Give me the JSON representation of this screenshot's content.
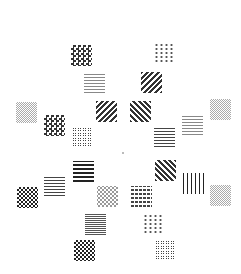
{
  "image": {
    "description": "Grid of textured pattern tiles arranged symmetrically around a central fixation dot",
    "background": "#ffffff",
    "center_dot": {
      "x": 122,
      "y": 152
    },
    "tiles": [
      {
        "id": "t1",
        "x": 71,
        "y": 45,
        "pattern": "p-check"
      },
      {
        "id": "t2",
        "x": 154,
        "y": 43,
        "pattern": "p-plus"
      },
      {
        "id": "t3",
        "x": 84,
        "y": 72,
        "pattern": "p-grid"
      },
      {
        "id": "t4",
        "x": 141,
        "y": 72,
        "pattern": "p-diag-l"
      },
      {
        "id": "t5",
        "x": 16,
        "y": 102,
        "pattern": "p-fine"
      },
      {
        "id": "t6",
        "x": 96,
        "y": 101,
        "pattern": "p-diag-l"
      },
      {
        "id": "t7",
        "x": 130,
        "y": 101,
        "pattern": "p-diag-r"
      },
      {
        "id": "t8",
        "x": 210,
        "y": 99,
        "pattern": "p-fine"
      },
      {
        "id": "t9",
        "x": 44,
        "y": 115,
        "pattern": "p-check"
      },
      {
        "id": "t10",
        "x": 182,
        "y": 114,
        "pattern": "p-grid"
      },
      {
        "id": "t11",
        "x": 72,
        "y": 127,
        "pattern": "p-hex"
      },
      {
        "id": "t12",
        "x": 154,
        "y": 126,
        "pattern": "p-wave"
      },
      {
        "id": "t13",
        "x": 73,
        "y": 161,
        "pattern": "p-hbar"
      },
      {
        "id": "t14",
        "x": 155,
        "y": 160,
        "pattern": "p-diag-r"
      },
      {
        "id": "t15",
        "x": 44,
        "y": 175,
        "pattern": "p-wave"
      },
      {
        "id": "t16",
        "x": 183,
        "y": 173,
        "pattern": "p-vbar"
      },
      {
        "id": "t17",
        "x": 17,
        "y": 187,
        "pattern": "p-trigrid"
      },
      {
        "id": "t18",
        "x": 97,
        "y": 186,
        "pattern": "p-cee"
      },
      {
        "id": "t19",
        "x": 131,
        "y": 186,
        "pattern": "p-dash"
      },
      {
        "id": "t20",
        "x": 210,
        "y": 185,
        "pattern": "p-fine"
      },
      {
        "id": "t21",
        "x": 85,
        "y": 214,
        "pattern": "p-hbar-thin"
      },
      {
        "id": "t22",
        "x": 143,
        "y": 214,
        "pattern": "p-plus"
      },
      {
        "id": "t23",
        "x": 74,
        "y": 240,
        "pattern": "p-trigrid"
      },
      {
        "id": "t24",
        "x": 155,
        "y": 240,
        "pattern": "p-hex"
      }
    ]
  }
}
